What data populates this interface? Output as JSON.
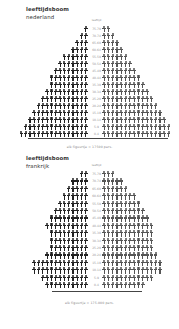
{
  "chart_data": [
    {
      "type": "bar",
      "subtype": "population-pyramid (pictogram)",
      "title": "leeftijdsboom nederland",
      "title_line1": "leeftijdsboom",
      "title_line2": "nederland",
      "center_header": "leeftijd",
      "age_groups": [
        "75-79",
        "70-74",
        "65-69",
        "60-64",
        "55-59",
        "50-54",
        "45-49",
        "40-44",
        "35-39",
        "30-34",
        "25-29",
        "20-24",
        "15-19",
        "10-14",
        "5-9",
        "0-4"
      ],
      "series": [
        {
          "name": "left (men)",
          "values": [
            1,
            2,
            3,
            4,
            6,
            7,
            8,
            9,
            9,
            10,
            11,
            12,
            13,
            14,
            15,
            16
          ]
        },
        {
          "name": "right (women)",
          "values": [
            2,
            3,
            4,
            5,
            6,
            7,
            8,
            9,
            10,
            11,
            12,
            13,
            14,
            15,
            16,
            16
          ]
        }
      ],
      "caption": "elk figuurtje = 17500 pers.",
      "xlabel": "",
      "ylabel": ""
    },
    {
      "type": "bar",
      "subtype": "population-pyramid (pictogram)",
      "title": "leeftijdsboom frankrijk",
      "title_line1": "leeftijdsboom",
      "title_line2": "frankrijk",
      "center_header": "leeftijd",
      "age_groups": [
        "75-79",
        "70-74",
        "65-69",
        "60-64",
        "55-59",
        "50-54",
        "45-49",
        "40-44",
        "35-39",
        "30-34",
        "25-29",
        "20-24",
        "15-19",
        "10-14",
        "5-9",
        "0-4"
      ],
      "series": [
        {
          "name": "left (men)",
          "values": [
            2,
            4,
            5,
            6,
            7,
            8,
            9,
            10,
            9,
            9,
            9,
            10,
            13,
            13,
            11,
            10
          ]
        },
        {
          "name": "right (women)",
          "values": [
            3,
            5,
            6,
            8,
            9,
            10,
            11,
            12,
            12,
            12,
            12,
            13,
            14,
            14,
            12,
            10
          ]
        }
      ],
      "caption": "elk figuurtje = 175.000 pers.",
      "xlabel": "",
      "ylabel": ""
    }
  ],
  "netherlands": {
    "title_line1": "leeftijdsboom",
    "title_line2": "nederland",
    "center_header": "leeftijd",
    "caption": "elk figuurtje = 17500 pers."
  },
  "france": {
    "title_line1": "leeftijdsboom",
    "title_line2": "frankrijk",
    "center_header": "leeftijd",
    "caption": "elk figuurtje = 175.000 pers."
  }
}
